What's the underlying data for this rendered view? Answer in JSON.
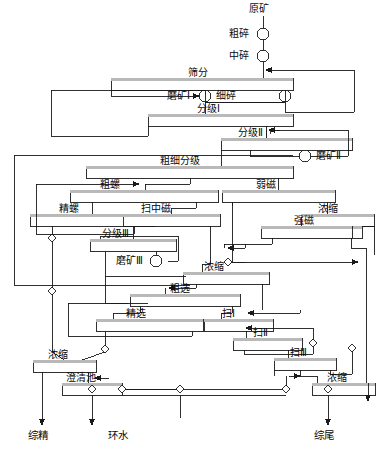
{
  "diagram": {
    "type": "mineral-processing-flowsheet",
    "colors": {
      "line": "#1a1a1a",
      "text": "#0a0a0a",
      "background": "#ffffff",
      "unit_fill": "#ffffff",
      "unit_top_band": "#b8b8b8"
    },
    "feed": {
      "label": "原矿"
    },
    "terminals": [
      {
        "id": "t1",
        "label": "综精"
      },
      {
        "id": "t2",
        "label": "环水"
      },
      {
        "id": "t3",
        "label": "综尾"
      }
    ],
    "circle_units": [
      {
        "id": "c1",
        "label": "粗碎"
      },
      {
        "id": "c2",
        "label": "中碎"
      },
      {
        "id": "c3",
        "label": "细碎"
      },
      {
        "id": "c4",
        "label": "磨矿Ⅰ"
      },
      {
        "id": "c5",
        "label": "磨矿Ⅱ"
      },
      {
        "id": "c6",
        "label": "磨矿Ⅲ"
      }
    ],
    "box_units": [
      {
        "id": "b01",
        "label": "筛分"
      },
      {
        "id": "b02",
        "label": "分级Ⅰ"
      },
      {
        "id": "b03",
        "label": "分级Ⅱ"
      },
      {
        "id": "b04",
        "label": "粗细分级"
      },
      {
        "id": "b05",
        "label": "粗螺"
      },
      {
        "id": "b06",
        "label": "弱磁"
      },
      {
        "id": "b07",
        "label": "精螺"
      },
      {
        "id": "b08",
        "label": "扫中磁"
      },
      {
        "id": "b09",
        "label": "浓缩"
      },
      {
        "id": "b10",
        "label": "强磁"
      },
      {
        "id": "b11",
        "label": "分级Ⅲ"
      },
      {
        "id": "b12",
        "label": "浓缩"
      },
      {
        "id": "b13",
        "label": "粗选"
      },
      {
        "id": "b14",
        "label": "精选"
      },
      {
        "id": "b15",
        "label": "扫Ⅰ"
      },
      {
        "id": "b16",
        "label": "扫Ⅱ"
      },
      {
        "id": "b17",
        "label": "扫Ⅲ"
      },
      {
        "id": "b18",
        "label": "浓缩"
      },
      {
        "id": "b19",
        "label": "澄清池"
      },
      {
        "id": "b20",
        "label": "浓缩"
      }
    ]
  }
}
